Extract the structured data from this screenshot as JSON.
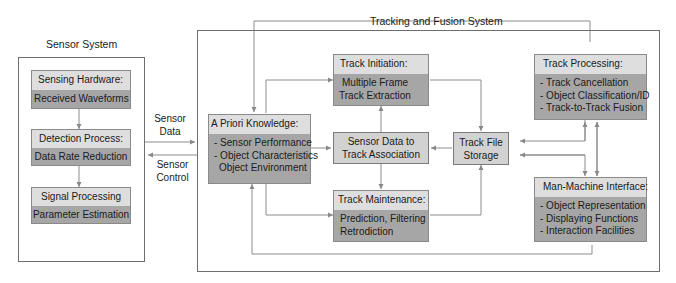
{
  "sensor_system": {
    "title": "Sensor System",
    "blocks": [
      {
        "header": "Sensing Hardware:",
        "body": [
          "Received Waveforms"
        ]
      },
      {
        "header": "Detection Process:",
        "body": [
          "Data Rate Reduction"
        ]
      },
      {
        "header": "Signal Processing",
        "body": [
          "Parameter Estimation"
        ]
      }
    ]
  },
  "links": {
    "sensor_data": [
      "Sensor",
      "Data"
    ],
    "sensor_control": [
      "Sensor",
      "Control"
    ]
  },
  "tracking_system": {
    "title": "Tracking and Fusion System",
    "a_priori": {
      "header": "A Priori Knowledge:",
      "body": [
        "- Sensor Performance",
        "- Object Characteristics",
        "  Object Environment"
      ]
    },
    "track_initiation": {
      "header": "Track Initiation:",
      "body": [
        "Multiple Frame",
        "Track Extraction"
      ]
    },
    "association": {
      "lines": [
        "Sensor Data to",
        "Track Association"
      ]
    },
    "track_maintenance": {
      "header": "Track Maintenance:",
      "body": [
        "Prediction, Filtering",
        "Retrodiction"
      ]
    },
    "track_file_storage": {
      "lines": [
        "Track File",
        "Storage"
      ]
    },
    "track_processing": {
      "header": "Track Processing:",
      "body": [
        "- Track Cancellation",
        "- Object Classification/ID",
        "- Track-to-Track Fusion"
      ]
    },
    "mmi": {
      "header": "Man-Machine Interface:",
      "body": [
        "- Object Representation",
        "- Displaying Functions",
        "- Interaction Facilities"
      ]
    }
  },
  "colors": {
    "header_fill": "#dedede",
    "body_fill": "#a6a6a6",
    "plain_fill": "#d2d2d2",
    "line": "#8a8a8a"
  }
}
